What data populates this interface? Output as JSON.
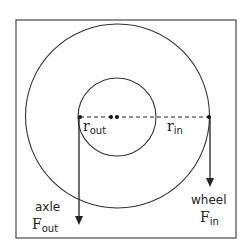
{
  "diagram": {
    "colors": {
      "stroke": "#333333",
      "frame": "#555555",
      "background": "#ffffff"
    },
    "labels": {
      "r_out": {
        "base": "r",
        "sub": "out"
      },
      "r_in": {
        "base": "r",
        "sub": "in"
      },
      "axle": "axle",
      "F_out": {
        "base": "F",
        "sub": "out"
      },
      "wheel": "wheel",
      "F_in": {
        "base": "F",
        "sub": "in"
      }
    },
    "shapes": {
      "frame": "square-border",
      "outer_circle": "wheel",
      "inner_circle": "axle",
      "radius_line": "dashed",
      "arrows": [
        "axle-force-arrow",
        "wheel-force-arrow"
      ]
    }
  }
}
